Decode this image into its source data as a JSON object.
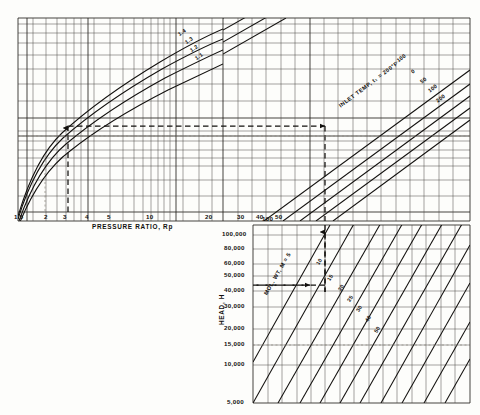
{
  "figure": {
    "background_color": "#fdfdfb",
    "ink_color": "#12100e",
    "grid_color": "#3a3833"
  },
  "panels": {
    "pressure_ratio": {
      "name": "pressure-ratio-panel",
      "x_axis_title": "PRESSURE RATIO, Rp",
      "x_ticks": [
        "1.5",
        "2",
        "3",
        "4",
        "5",
        "10",
        "20",
        "30",
        "40",
        "50",
        "100"
      ],
      "curve_family_labels": [
        "1.4",
        "1.3",
        "1.2",
        "1.1"
      ]
    },
    "inlet_temp": {
      "name": "inlet-temperature-panel",
      "family_title": "INLET TEMP, t₁ = 200°F",
      "curve_labels": [
        "-100",
        "0",
        "50",
        "100",
        "200"
      ]
    },
    "head": {
      "name": "head-panel",
      "y_axis_title": "HEAD, H",
      "y_ticks": [
        "100,000",
        "80,000",
        "60,000",
        "50,000",
        "40,000",
        "30,000",
        "20,000",
        "15,000",
        "10,000",
        "5,000"
      ],
      "top_tick": "100",
      "family_title": "MOL. WT, M = 5",
      "curve_labels": [
        "10",
        "15",
        "20",
        "25",
        "30",
        "40",
        "50",
        "70"
      ]
    }
  },
  "construction_path": {
    "name": "worked-example-path",
    "pressure_ratio_entry": "3.5",
    "head_value": "36,000",
    "segments": [
      {
        "id": "vertical-up-from-pressure-ratio",
        "direction": "up"
      },
      {
        "id": "horizontal-right-to-inlet-temp",
        "direction": "right"
      },
      {
        "id": "vertical-down-to-head-panel",
        "direction": "down"
      },
      {
        "id": "horizontal-left-to-head-axis",
        "direction": "left"
      }
    ]
  }
}
